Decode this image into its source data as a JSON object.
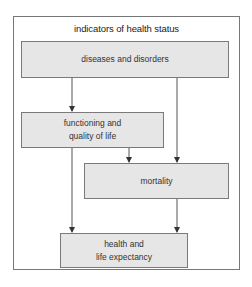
{
  "diagram": {
    "title": "indicators of health status",
    "nodes": {
      "diseases": {
        "label": "diseases and disorders"
      },
      "functioning": {
        "line1": "functioning and",
        "line2": "quality of life"
      },
      "mortality": {
        "label": "mortality"
      },
      "health": {
        "line1": "health and",
        "line2": "life expectancy"
      }
    },
    "edges": [
      {
        "from": "diseases and disorders",
        "to": "functioning and quality of life"
      },
      {
        "from": "diseases and disorders",
        "to": "mortality"
      },
      {
        "from": "functioning and quality of life",
        "to": "mortality"
      },
      {
        "from": "functioning and quality of life",
        "to": "health and life expectancy"
      },
      {
        "from": "mortality",
        "to": "health and life expectancy"
      }
    ],
    "colors": {
      "box_fill": "#e6e6e6",
      "box_border": "#7a7a7a",
      "line": "#555555"
    }
  }
}
